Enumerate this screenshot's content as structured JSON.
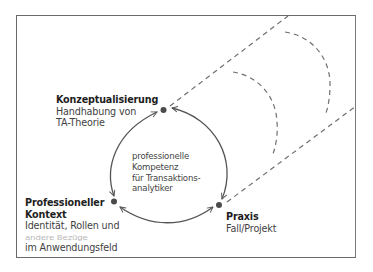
{
  "diagram": {
    "nodes": {
      "konzeptualisierung": {
        "title": "Konzeptualisierung",
        "lines": [
          "Handhabung von",
          "TA-Theorie"
        ]
      },
      "kontext": {
        "title_lines": [
          "Professioneller",
          "Kontext"
        ],
        "lines": [
          "Identität, Rollen und",
          "andere Bezüge",
          "im Anwendungsfeld"
        ]
      },
      "praxis": {
        "title": "Praxis",
        "lines": [
          "Fall/Projekt"
        ]
      }
    },
    "center": {
      "lines": [
        "professionelle",
        "Kompetenz",
        "für Transaktions-",
        "analytiker"
      ]
    },
    "colors": {
      "frame": "#6a6a6a",
      "arrows": "#555555",
      "dots": "#4a4a4a",
      "dashes": "#6f6f6f",
      "title_text": "#1e1e1e",
      "body_text": "#3f3f3f"
    }
  }
}
